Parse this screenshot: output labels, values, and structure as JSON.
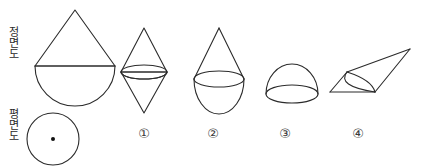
{
  "figure": {
    "type": "orthographic-projection-multiple-choice",
    "background_color": "#ffffff",
    "stroke_color": "#2b2b2b",
    "width": 421,
    "height": 166
  },
  "row_labels": {
    "front_view": "정면도",
    "top_view": "평면도"
  },
  "given_views": {
    "front_view": {
      "name": "cone-over-hemisphere-outline",
      "description": "teardrop: triangle apex on top of a semicircular bottom with a horizontal dividing line",
      "apex": {
        "x": 75,
        "y": 10
      },
      "base_left": {
        "x": 35,
        "y": 66
      },
      "base_right": {
        "x": 115,
        "y": 66
      },
      "hemisphere_bottom_y": 106,
      "divider_line_y": 66
    },
    "top_view": {
      "name": "circle-with-center-dot",
      "center": {
        "x": 53,
        "y": 139
      },
      "radius": 26,
      "center_dot_radius": 2
    }
  },
  "options": [
    {
      "number": "①",
      "label": "1",
      "name": "bicone",
      "description": "double cone (two cones joined base to base) with a mid ellipse",
      "top_apex": {
        "x": 144,
        "y": 28
      },
      "bottom_apex": {
        "x": 144,
        "y": 113
      },
      "ellipse": {
        "cx": 144,
        "cy": 72,
        "rx": 23,
        "ry": 7
      }
    },
    {
      "number": "②",
      "label": "2",
      "name": "cone-over-hemisphere",
      "description": "cone sitting on a hemisphere with an ellipse at the junction",
      "apex": {
        "x": 219,
        "y": 28
      },
      "ellipse": {
        "cx": 219,
        "cy": 79,
        "rx": 25,
        "ry": 8
      },
      "hemisphere_bottom_y": 114
    },
    {
      "number": "③",
      "label": "3",
      "name": "hemisphere-dome",
      "description": "dome / hemisphere with an elliptical base",
      "top": {
        "x": 292,
        "y": 64
      },
      "ellipse": {
        "cx": 292,
        "cy": 94,
        "rx": 26,
        "ry": 8
      }
    },
    {
      "number": "④",
      "label": "4",
      "name": "oblique-cone",
      "description": "slanted oblique cone with apex pointing to the upper right and a tilted base ellipse on the left",
      "apex": {
        "x": 410,
        "y": 49
      },
      "base_left": {
        "x": 330,
        "y": 92
      },
      "base_top": {
        "x": 347,
        "y": 72
      },
      "base_bottom": {
        "x": 375,
        "y": 92
      }
    }
  ]
}
